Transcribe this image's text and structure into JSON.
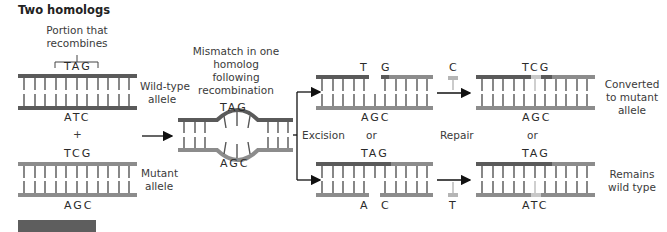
{
  "title": "Two homologs",
  "labels": {
    "portion": [
      "Portion that",
      "recombines"
    ],
    "wild_type_allele": [
      "Wild-type",
      "allele"
    ],
    "mutant_allele": [
      "Mutant",
      "allele"
    ],
    "plus": "+",
    "mismatch": [
      "Mismatch in one",
      "homolog",
      "following",
      "recombination"
    ],
    "excision": "Excision",
    "repair": "Repair",
    "or1": "or",
    "or2": "or",
    "converted": [
      "Converted",
      "to mutant",
      "allele"
    ],
    "remains": [
      "Remains",
      "wild type"
    ]
  },
  "bases": {
    "wt_top": "TAG",
    "wt_bottom": "ATC",
    "mut_top": "TCG",
    "mut_bottom": "AGC",
    "mismatch_top": "TAG",
    "mismatch_bottom": "AGC",
    "excA_top_T": "T",
    "excA_top_G": "G",
    "excA_bottom": "AGC",
    "repairA_free": "C",
    "excB_top": "TAG",
    "excB_bottom_A": "A",
    "excB_bottom_C": "C",
    "repairB_free": "T",
    "resA_top": "TCG",
    "resA_bottom": "AGC",
    "resB_top": "TAG",
    "resB_bottom": "ATC"
  },
  "colors": {
    "dark_strand": "#5a5a5a",
    "mid_strand": "#8c8c8c",
    "light_strand": "#b5b5b5",
    "new_base": "#c8c8c8",
    "rung": "#555555",
    "arrow": "#111111"
  }
}
